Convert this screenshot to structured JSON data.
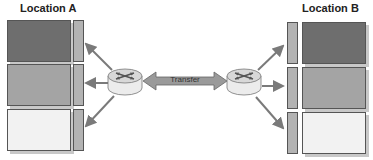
{
  "diagram": {
    "left": {
      "title": "Location A",
      "boxes": [
        {
          "shade": "dark",
          "color": "#6e6e6e"
        },
        {
          "shade": "medium",
          "color": "#a4a4a4"
        },
        {
          "shade": "light",
          "color": "#f2f2f2"
        }
      ]
    },
    "right": {
      "title": "Location B",
      "boxes": [
        {
          "shade": "dark",
          "color": "#6e6e6e"
        },
        {
          "shade": "medium",
          "color": "#a4a4a4"
        },
        {
          "shade": "light",
          "color": "#f2f2f2"
        }
      ]
    },
    "link": {
      "label": "Transfer",
      "direction": "bidirectional"
    },
    "nodes": [
      "router-icon",
      "router-icon"
    ],
    "colors": {
      "arrow": "#7a7a7a",
      "bar": "#b3b3b3",
      "router_top": "#d8d8d8",
      "router_side": "#ececec",
      "transfer_arrow": "#9a9a9a"
    }
  }
}
